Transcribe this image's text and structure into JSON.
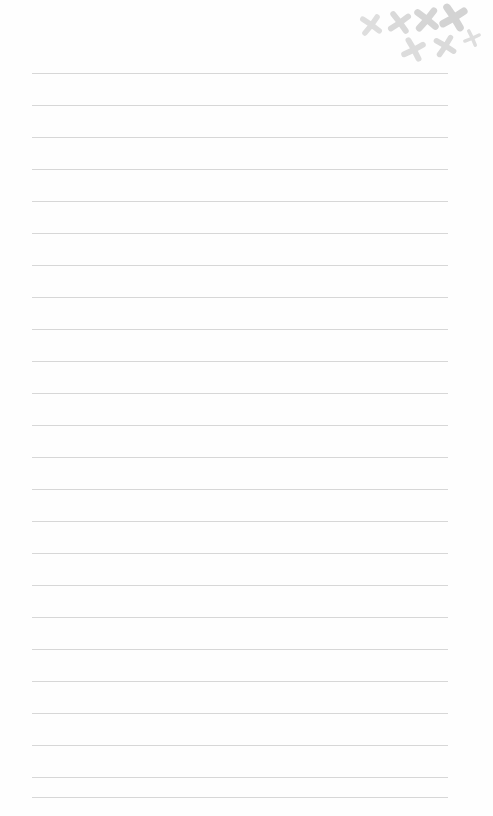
{
  "page": {
    "width": 493,
    "height": 816,
    "background_color": "#fefefe",
    "orientation": "portrait",
    "content_text": ""
  },
  "ruled_lines": {
    "count": 24,
    "color": "#d7d7d7",
    "thickness_px": 1,
    "first_line_y": 73,
    "spacing_px": 32,
    "left_x": 32,
    "right_x": 448,
    "length_px": 416,
    "lines": [
      {
        "index": 1,
        "y": 73,
        "text": ""
      },
      {
        "index": 2,
        "y": 105,
        "text": ""
      },
      {
        "index": 3,
        "y": 137,
        "text": ""
      },
      {
        "index": 4,
        "y": 169,
        "text": ""
      },
      {
        "index": 5,
        "y": 201,
        "text": ""
      },
      {
        "index": 6,
        "y": 233,
        "text": ""
      },
      {
        "index": 7,
        "y": 265,
        "text": ""
      },
      {
        "index": 8,
        "y": 297,
        "text": ""
      },
      {
        "index": 9,
        "y": 329,
        "text": ""
      },
      {
        "index": 10,
        "y": 361,
        "text": ""
      },
      {
        "index": 11,
        "y": 393,
        "text": ""
      },
      {
        "index": 12,
        "y": 425,
        "text": ""
      },
      {
        "index": 13,
        "y": 457,
        "text": ""
      },
      {
        "index": 14,
        "y": 489,
        "text": ""
      },
      {
        "index": 15,
        "y": 521,
        "text": ""
      },
      {
        "index": 16,
        "y": 553,
        "text": ""
      },
      {
        "index": 17,
        "y": 585,
        "text": ""
      },
      {
        "index": 18,
        "y": 617,
        "text": ""
      },
      {
        "index": 19,
        "y": 649,
        "text": ""
      },
      {
        "index": 20,
        "y": 681,
        "text": ""
      },
      {
        "index": 21,
        "y": 713,
        "text": ""
      },
      {
        "index": 22,
        "y": 745,
        "text": ""
      },
      {
        "index": 23,
        "y": 777,
        "text": ""
      },
      {
        "index": 24,
        "y": 797,
        "text": ""
      }
    ]
  },
  "doodles": {
    "label": "x-mark cluster",
    "color": "#dadada",
    "count": 7,
    "marks": [
      {
        "name": "x-mark-1",
        "x": 358,
        "y": 12,
        "size": 26,
        "rotation": -8,
        "stroke": 5.0,
        "color": "#dedede"
      },
      {
        "name": "x-mark-2",
        "x": 386,
        "y": 9,
        "size": 27,
        "rotation": 10,
        "stroke": 5.2,
        "color": "#d9d9d9"
      },
      {
        "name": "x-mark-3",
        "x": 412,
        "y": 5,
        "size": 29,
        "rotation": -5,
        "stroke": 5.6,
        "color": "#d5d5d5"
      },
      {
        "name": "x-mark-4",
        "x": 438,
        "y": 2,
        "size": 31,
        "rotation": 14,
        "stroke": 5.8,
        "color": "#d3d3d3"
      },
      {
        "name": "x-mark-5",
        "x": 400,
        "y": 36,
        "size": 27,
        "rotation": 18,
        "stroke": 5.2,
        "color": "#dcdcdc"
      },
      {
        "name": "x-mark-6",
        "x": 432,
        "y": 33,
        "size": 26,
        "rotation": -12,
        "stroke": 5.0,
        "color": "#dadada"
      },
      {
        "name": "x-mark-7",
        "x": 462,
        "y": 28,
        "size": 20,
        "rotation": 22,
        "stroke": 4.2,
        "color": "#dedede"
      }
    ]
  }
}
